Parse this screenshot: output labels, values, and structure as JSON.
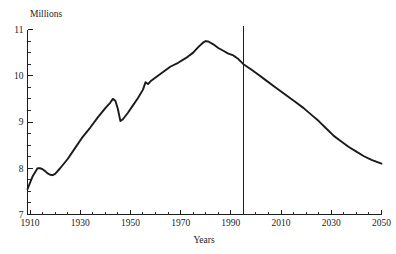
{
  "chart_data": {
    "type": "line",
    "title": "",
    "xlabel": "Years",
    "ylabel": "Millions",
    "xlim": [
      1909,
      2050
    ],
    "ylim": [
      7,
      11
    ],
    "grid": false,
    "legend": null,
    "y_ticks": [
      7,
      8,
      9,
      10,
      11
    ],
    "y_tick_labels": [
      "7",
      "8",
      "9",
      "10",
      "11"
    ],
    "y_minor_step": 0.25,
    "x_ticks": [
      1910,
      1930,
      1950,
      1970,
      1990,
      2010,
      2030,
      2050
    ],
    "x_tick_labels": [
      "1910",
      "1930",
      "1950",
      "1970",
      "1990",
      "2010",
      "2030",
      "2050"
    ],
    "x_minor_step": 5,
    "annotations": [
      {
        "name": "projection-divider",
        "type": "vertical-line",
        "x": 1995,
        "label": ""
      }
    ],
    "series": [
      {
        "name": "population",
        "x": [
          1909,
          1911,
          1913,
          1914,
          1915,
          1916,
          1917,
          1918,
          1919,
          1920,
          1922,
          1925,
          1928,
          1931,
          1934,
          1937,
          1940,
          1942,
          1943,
          1944,
          1945,
          1946,
          1947,
          1949,
          1951,
          1953,
          1955,
          1956,
          1957,
          1958,
          1960,
          1963,
          1966,
          1969,
          1972,
          1975,
          1977,
          1979,
          1980,
          1981,
          1983,
          1985,
          1987,
          1989,
          1991,
          1993,
          1995,
          1998,
          2001,
          2004,
          2007,
          2010,
          2013,
          2016,
          2019,
          2022,
          2025,
          2028,
          2031,
          2034,
          2037,
          2040,
          2043,
          2046,
          2050
        ],
        "y": [
          7.55,
          7.82,
          8.0,
          8.0,
          7.98,
          7.94,
          7.89,
          7.86,
          7.85,
          7.88,
          8.0,
          8.2,
          8.44,
          8.68,
          8.88,
          9.1,
          9.3,
          9.42,
          9.5,
          9.46,
          9.28,
          9.02,
          9.06,
          9.2,
          9.36,
          9.52,
          9.7,
          9.86,
          9.82,
          9.88,
          9.96,
          10.08,
          10.2,
          10.28,
          10.38,
          10.5,
          10.62,
          10.72,
          10.75,
          10.74,
          10.68,
          10.6,
          10.54,
          10.48,
          10.44,
          10.36,
          10.25,
          10.14,
          10.02,
          9.9,
          9.78,
          9.66,
          9.54,
          9.42,
          9.3,
          9.16,
          9.02,
          8.86,
          8.7,
          8.58,
          8.46,
          8.36,
          8.26,
          8.18,
          8.1
        ]
      }
    ]
  },
  "labels": {
    "y_axis_caption": "Millions",
    "x_axis_caption": "Years"
  }
}
